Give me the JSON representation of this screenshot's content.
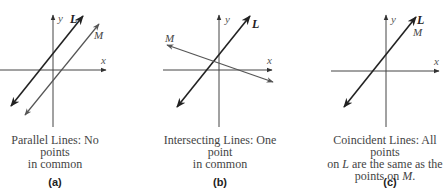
{
  "panels": [
    {
      "id": "a",
      "label": "(a)",
      "caption_line1": "Parallel Lines: No points",
      "caption_line2": "in common",
      "axis_x_label": "x",
      "axis_y_label": "y",
      "line_L_label": "L",
      "line_M_label": "M"
    },
    {
      "id": "b",
      "label": "(b)",
      "caption_line1": "Intersecting Lines: One point",
      "caption_line2": "in common",
      "axis_x_label": "x",
      "axis_y_label": "y",
      "line_L_label": "L",
      "line_M_label": "M"
    },
    {
      "id": "c",
      "label": "(c)",
      "caption_line1": "Coincident Lines: All points",
      "caption_line2_prefix": "on ",
      "caption_line2_var": "L",
      "caption_line2_suffix": " are the same as the",
      "caption_line3_prefix": "points on ",
      "caption_line3_var": "M",
      "caption_line3_suffix": ".",
      "axis_x_label": "x",
      "axis_y_label": "y",
      "line_L_label": "L",
      "line_M_label": "M"
    }
  ],
  "colors": {
    "axis": "#333333",
    "line_L": "#222222",
    "line_M": "#555555",
    "text": "#444444"
  }
}
